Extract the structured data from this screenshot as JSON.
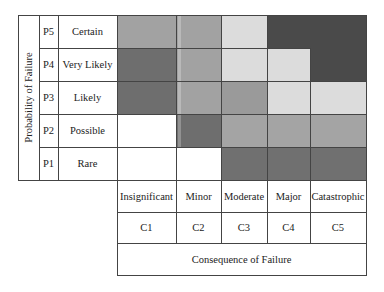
{
  "matrix": {
    "y_axis_title": "Probability of Failure",
    "x_axis_title": "Consequence of Failure",
    "rows": [
      {
        "code": "P5",
        "label": "Certain"
      },
      {
        "code": "P4",
        "label": "Very Likely"
      },
      {
        "code": "P3",
        "label": "Likely"
      },
      {
        "code": "P2",
        "label": "Possible"
      },
      {
        "code": "P1",
        "label": "Rare"
      }
    ],
    "columns": [
      {
        "code": "C1",
        "label": "Insignificant"
      },
      {
        "code": "C2",
        "label": "Minor"
      },
      {
        "code": "C3",
        "label": "Moderate"
      },
      {
        "code": "C4",
        "label": "Major"
      },
      {
        "code": "C5",
        "label": "Catastrophic"
      }
    ],
    "cell_colors": [
      [
        "#a2a2a2",
        "#a2a2a2",
        "#dcdcdc",
        "#4a4a4a",
        "#4a4a4a"
      ],
      [
        "#6e6e6e",
        "#a2a2a2",
        "#dcdcdc",
        "#dcdcdc",
        "#4a4a4a"
      ],
      [
        "#6e6e6e",
        "#a2a2a2",
        "#9a9a9a",
        "#dcdcdc",
        "#dcdcdc"
      ],
      [
        "#ffffff",
        "#6e6e6e",
        "#a4a4a4",
        "#a4a4a4",
        "#a4a4a4"
      ],
      [
        "#ffffff",
        "#ffffff",
        "#707070",
        "#707070",
        "#707070"
      ]
    ],
    "palette": {
      "very_dark": "#4a4a4a",
      "dark": "#6e6e6e",
      "medium": "#a2a2a2",
      "light": "#dcdcdc",
      "white": "#ffffff",
      "grid_line": "#444444"
    }
  }
}
